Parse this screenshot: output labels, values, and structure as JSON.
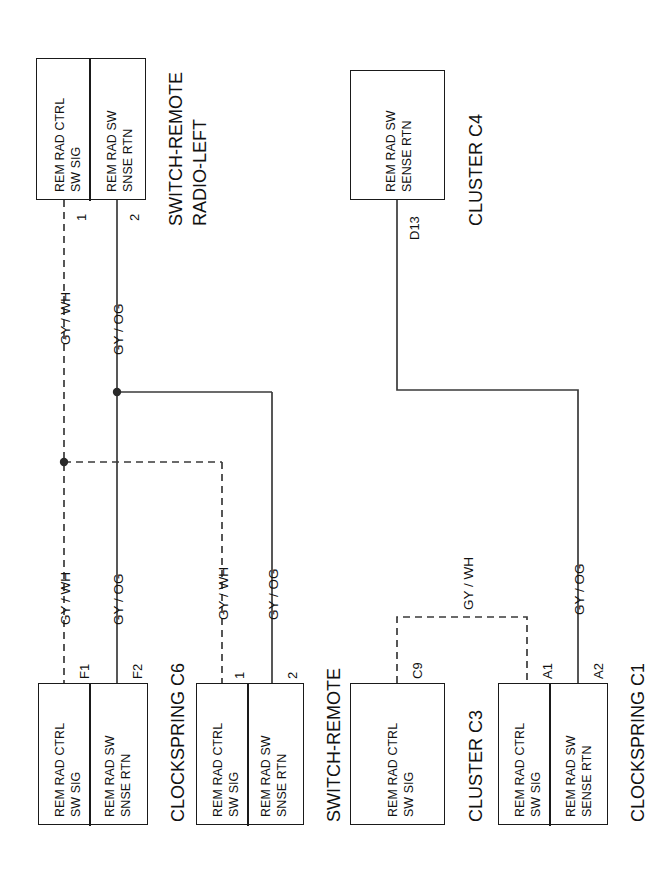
{
  "diagram": {
    "orientation": "rotated-90-ccw",
    "line_color": "#333333",
    "box_border_color": "#1a1a1a",
    "background": "#ffffff"
  },
  "components": [
    {
      "id": "switch-remote-radio-left",
      "name": "SWITCH-REMOTE\nRADIO-LEFT",
      "name_line1": "SWITCH-REMOTE",
      "name_line2": "RADIO-LEFT",
      "terminals": [
        {
          "label_line1": "REM RAD CTRL",
          "label_line2": "SW SIG",
          "pin": "1"
        },
        {
          "label_line1": "REM RAD SW",
          "label_line2": "SNSE RTN",
          "pin": "2"
        }
      ]
    },
    {
      "id": "cluster-c4",
      "name": "CLUSTER C4",
      "name_line1": "CLUSTER C4",
      "name_line2": "",
      "terminals": [
        {
          "label_line1": "REM RAD SW",
          "label_line2": "SENSE RTN",
          "pin": "D13"
        }
      ]
    },
    {
      "id": "clockspring-c6",
      "name": "CLOCKSPRING C6",
      "name_line1": "CLOCKSPRING C6",
      "name_line2": "",
      "terminals": [
        {
          "label_line1": "REM RAD CTRL",
          "label_line2": "SW SIG",
          "pin": "F1"
        },
        {
          "label_line1": "REM RAD SW",
          "label_line2": "SNSE RTN",
          "pin": "F2"
        }
      ]
    },
    {
      "id": "switch-remote-radio-right",
      "name": "SWITCH-REMOTE\nRADIO-RIGHT",
      "name_line1": "SWITCH-REMOTE",
      "name_line2": "RADIO-RIGHT",
      "terminals": [
        {
          "label_line1": "REM RAD CTRL",
          "label_line2": "SW SIG",
          "pin": "1"
        },
        {
          "label_line1": "REM RAD SW",
          "label_line2": "SNSE RTN",
          "pin": "2"
        }
      ]
    },
    {
      "id": "cluster-c3",
      "name": "CLUSTER C3",
      "name_line1": "CLUSTER C3",
      "name_line2": "",
      "terminals": [
        {
          "label_line1": "REM RAD CTRL",
          "label_line2": "SW SIG",
          "pin": "C9"
        }
      ]
    },
    {
      "id": "clockspring-c1",
      "name": "CLOCKSPRING C1",
      "name_line1": "CLOCKSPRING C1",
      "name_line2": "",
      "terminals": [
        {
          "label_line1": "REM RAD CTRL",
          "label_line2": "SW SIG",
          "pin": "A1"
        },
        {
          "label_line1": "REM RAD SW",
          "label_line2": "SENSE RTN",
          "pin": "A2"
        }
      ]
    }
  ],
  "wire_labels": {
    "gy_wh": "GY / WH",
    "gy_og": "GY / OG",
    "w1": "GY / WH",
    "w2": "GY / OG",
    "w3": "GY / WH",
    "w4": "GY / OG",
    "w5": "GY / WH",
    "w6": "GY / OG",
    "w7": "GY / WH",
    "w8": "GY / OG"
  },
  "pins": {
    "left_switch_1": "1",
    "left_switch_2": "2",
    "cluster_c4_d13": "D13",
    "clockspring_c6_f1": "F1",
    "clockspring_c6_f2": "F2",
    "right_switch_1": "1",
    "right_switch_2": "2",
    "cluster_c3_c9": "C9",
    "clockspring_c1_a1": "A1",
    "clockspring_c1_a2": "A2"
  },
  "nets": [
    {
      "name": "REM RAD CTRL SW SIG",
      "color_code": "GY / WH",
      "style": "dashed",
      "nodes": [
        "switch-remote-radio-left.1",
        "clockspring-c6.F1",
        "switch-remote-radio-right.1",
        "cluster-c3.C9",
        "clockspring-c1.A1"
      ]
    },
    {
      "name": "REM RAD SW SENSE RTN",
      "color_code": "GY / OG",
      "style": "solid",
      "nodes": [
        "switch-remote-radio-left.2",
        "clockspring-c6.F2",
        "switch-remote-radio-right.2",
        "cluster-c4.D13",
        "clockspring-c1.A2"
      ]
    }
  ]
}
